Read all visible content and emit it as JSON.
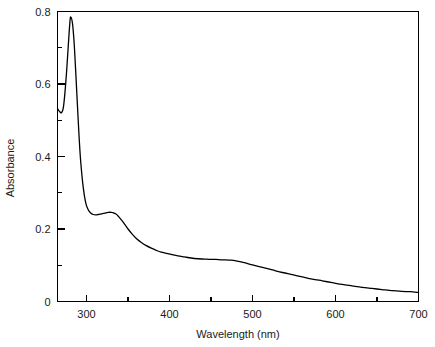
{
  "chart_data": {
    "type": "line",
    "title": "",
    "xlabel": "Wavelength (nm)",
    "ylabel": "Absorbance",
    "xlim": [
      265,
      700
    ],
    "ylim": [
      0,
      0.8
    ],
    "grid": false,
    "legend": null,
    "x_major_ticks": [
      300,
      400,
      500,
      600,
      700
    ],
    "x_minor_ticks": [
      350,
      450,
      550,
      650
    ],
    "x_tick_labels": [
      "300",
      "400",
      "500",
      "600",
      "700"
    ],
    "y_major_ticks": [
      0,
      0.2,
      0.4,
      0.6,
      0.8
    ],
    "y_minor_ticks": [
      0.1,
      0.3,
      0.5,
      0.7
    ],
    "y_tick_labels": [
      "0",
      "0.2",
      "0.4",
      "0.6",
      "0.8"
    ],
    "series": [
      {
        "name": "absorbance-spectrum",
        "color": "#000000",
        "x": [
          265,
          268,
          270,
          272,
          274,
          276,
          278,
          280,
          281,
          283,
          285,
          287,
          289,
          291,
          293,
          296,
          299,
          302,
          305,
          308,
          311,
          314,
          318,
          322,
          326,
          330,
          332,
          335,
          338,
          342,
          346,
          350,
          355,
          360,
          366,
          372,
          378,
          384,
          390,
          396,
          402,
          410,
          418,
          426,
          434,
          442,
          450,
          456,
          462,
          468,
          474,
          480,
          490,
          500,
          512,
          524,
          536,
          548,
          560,
          572,
          584,
          596,
          608,
          620,
          632,
          644,
          656,
          668,
          680,
          690,
          700
        ],
        "y": [
          0.532,
          0.523,
          0.521,
          0.534,
          0.577,
          0.636,
          0.706,
          0.772,
          0.785,
          0.768,
          0.715,
          0.632,
          0.542,
          0.455,
          0.385,
          0.315,
          0.272,
          0.253,
          0.244,
          0.24,
          0.239,
          0.24,
          0.242,
          0.244,
          0.246,
          0.246,
          0.245,
          0.242,
          0.236,
          0.225,
          0.213,
          0.2,
          0.186,
          0.174,
          0.163,
          0.154,
          0.147,
          0.141,
          0.136,
          0.133,
          0.13,
          0.126,
          0.123,
          0.12,
          0.118,
          0.117,
          0.116,
          0.116,
          0.115,
          0.115,
          0.114,
          0.112,
          0.107,
          0.101,
          0.094,
          0.087,
          0.08,
          0.074,
          0.068,
          0.062,
          0.057,
          0.052,
          0.047,
          0.043,
          0.039,
          0.036,
          0.033,
          0.03,
          0.028,
          0.027,
          0.025
        ],
        "annotations": [
          {
            "label": "peak",
            "x": 281,
            "y": 0.785
          },
          {
            "label": "shoulder",
            "x": 332,
            "y": 0.245
          }
        ]
      }
    ]
  },
  "axes": {
    "ylabel": "Absorbance",
    "xlabel": "Wavelength (nm)"
  },
  "colors": {
    "curve": "#000000",
    "frame": "#000000",
    "background": "#ffffff",
    "text": "#1a1a1a"
  }
}
